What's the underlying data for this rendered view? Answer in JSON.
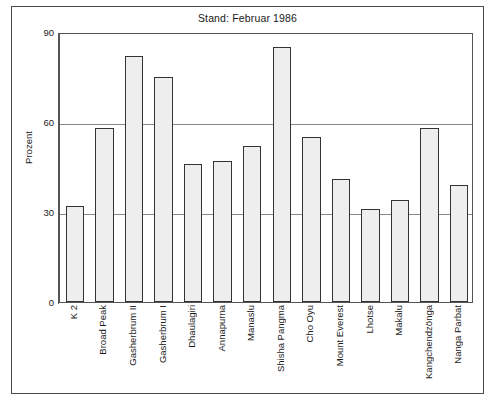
{
  "chart_data": {
    "type": "bar",
    "title": "Stand: Februar 1986",
    "xlabel": "",
    "ylabel": "Prozent",
    "ylim": [
      0,
      90
    ],
    "yticks": [
      0,
      30,
      60,
      90
    ],
    "grid": true,
    "legend": null,
    "categories": [
      "K 2",
      "Broad Peak",
      "Gasherbrum II",
      "Gasherbrum I",
      "Dhaulagiri",
      "Annapurna",
      "Manaslu",
      "Shisha Pangma",
      "Cho Oyu",
      "Mount Everest",
      "Lhotse",
      "Makalu",
      "Kangchendzönga",
      "Nanga Parbat"
    ],
    "values": [
      32,
      58,
      82,
      75,
      46,
      47,
      52,
      85,
      55,
      41,
      31,
      34,
      58,
      39
    ],
    "bar_fill_color": "#eeeeee",
    "bar_edge_color": "#333333",
    "grid_color": "#888888",
    "axis_color": "#555555",
    "frame_color": "#4a4a4a"
  }
}
